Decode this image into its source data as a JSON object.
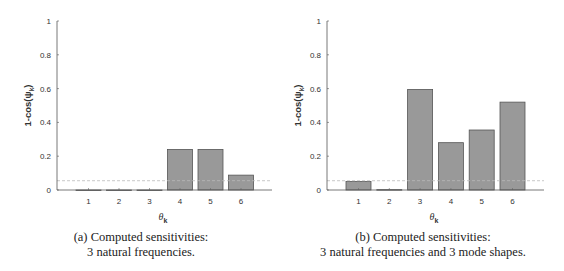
{
  "chart_data": [
    {
      "type": "bar",
      "id": "a",
      "title": "",
      "xlabel": "θ_k",
      "ylabel": "1-cos(ψ_k)",
      "categories": [
        "1",
        "2",
        "3",
        "4",
        "5",
        "6"
      ],
      "values": [
        0.0,
        0.0,
        0.0,
        0.24,
        0.24,
        0.088
      ],
      "ylim": [
        0,
        1
      ],
      "yticks": [
        "0",
        "0.2",
        "0.4",
        "0.6",
        "0.8",
        "1"
      ],
      "threshold_line": 0.055,
      "grid": false,
      "bar_color": "#999999",
      "caption_line1": "(a) Computed sensitivities:",
      "caption_line2": "3 natural frequencies."
    },
    {
      "type": "bar",
      "id": "b",
      "title": "",
      "xlabel": "θ_k",
      "ylabel": "1-cos(ψ_k)",
      "categories": [
        "1",
        "2",
        "3",
        "4",
        "5",
        "6"
      ],
      "values": [
        0.05,
        0.002,
        0.595,
        0.28,
        0.355,
        0.52
      ],
      "ylim": [
        0,
        1
      ],
      "yticks": [
        "0",
        "0.2",
        "0.4",
        "0.6",
        "0.8",
        "1"
      ],
      "threshold_line": 0.055,
      "grid": false,
      "bar_color": "#999999",
      "caption_line1": "(b) Computed sensitivities:",
      "caption_line2": "3 natural frequencies and 3 mode shapes."
    }
  ]
}
